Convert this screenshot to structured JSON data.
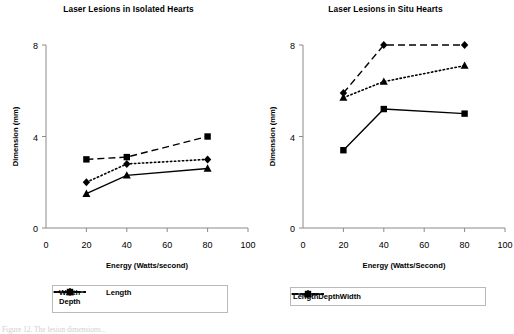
{
  "figure": {
    "caption_partial": "Figure 12. The lesion dimensions..."
  },
  "chart_data": [
    {
      "id": "isolated",
      "type": "line",
      "title": "Laser Lesions in Isolated Hearts",
      "xlabel": "Energy (Watts/second)",
      "ylabel": "Dimension (mm)",
      "x": [
        20,
        40,
        80
      ],
      "xlim": [
        0,
        100
      ],
      "ylim": [
        0,
        8
      ],
      "xticks": [
        0,
        20,
        40,
        60,
        80,
        100
      ],
      "yticks": [
        0,
        4,
        8
      ],
      "grid": false,
      "legend_position": "below",
      "legend_layout": "two-row",
      "series": [
        {
          "name": "Width",
          "marker": "diamond",
          "dash": "dotted",
          "values": [
            2.0,
            2.8,
            3.0
          ]
        },
        {
          "name": "Length",
          "marker": "square",
          "dash": "dashed",
          "values": [
            3.0,
            3.1,
            4.0
          ]
        },
        {
          "name": "Depth",
          "marker": "triangle",
          "dash": "solid",
          "values": [
            1.5,
            2.3,
            2.6
          ]
        }
      ],
      "legend_order": [
        "Width",
        "Length",
        "Depth"
      ]
    },
    {
      "id": "situ",
      "type": "line",
      "title": "Laser Lesions in Situ Hearts",
      "xlabel": "Energy (Watts/Second)",
      "ylabel": "Dimension (mm)",
      "x": [
        20,
        40,
        80
      ],
      "xlim": [
        0,
        100
      ],
      "ylim": [
        0,
        8
      ],
      "xticks": [
        0,
        20,
        40,
        60,
        80,
        100
      ],
      "yticks": [
        0,
        4,
        8
      ],
      "grid": false,
      "legend_position": "below",
      "legend_layout": "one-row",
      "series": [
        {
          "name": "Length",
          "marker": "diamond",
          "dash": "dashed",
          "values": [
            5.9,
            8.0,
            8.0
          ]
        },
        {
          "name": "Depth",
          "marker": "square",
          "dash": "solid",
          "values": [
            3.4,
            5.2,
            5.0
          ]
        },
        {
          "name": "Width",
          "marker": "triangle",
          "dash": "dotted",
          "values": [
            5.7,
            6.4,
            7.1
          ]
        }
      ],
      "legend_order": [
        "Length",
        "Depth",
        "Width"
      ]
    }
  ]
}
